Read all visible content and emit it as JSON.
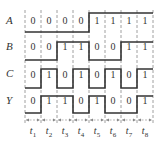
{
  "diagram": {
    "type": "timing-diagram",
    "signals": [
      {
        "name": "A",
        "bits": [
          "0",
          "0",
          "0",
          "0",
          "1",
          "1",
          "1",
          "1"
        ]
      },
      {
        "name": "B",
        "bits": [
          "0",
          "0",
          "1",
          "1",
          "0",
          "0",
          "1",
          "1"
        ]
      },
      {
        "name": "C",
        "bits": [
          "0",
          "1",
          "0",
          "1",
          "0",
          "1",
          "0",
          "1"
        ]
      },
      {
        "name": "Y",
        "bits": [
          "0",
          "1",
          "1",
          "0",
          "1",
          "0",
          "0",
          "1"
        ]
      }
    ],
    "time_intervals": [
      "t1",
      "t2",
      "t3",
      "t4",
      "t5",
      "t6",
      "t7",
      "t8"
    ],
    "time_label_base": "t",
    "time_label_subs": [
      "1",
      "2",
      "3",
      "4",
      "5",
      "6",
      "7",
      "8"
    ],
    "colors": {
      "line": "#333333",
      "dash": "#888888",
      "text": "#333333"
    }
  }
}
